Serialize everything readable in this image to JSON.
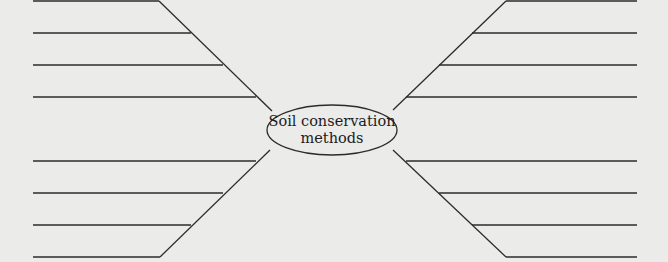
{
  "diagram": {
    "type": "spider-map",
    "center": {
      "line1": "Soil conservation",
      "line2": "methods"
    },
    "branches": [
      {
        "position": "top-left",
        "blank_lines": 4
      },
      {
        "position": "top-right",
        "blank_lines": 4
      },
      {
        "position": "bottom-left",
        "blank_lines": 4
      },
      {
        "position": "bottom-right",
        "blank_lines": 4
      }
    ],
    "colors": {
      "background": "#ebebea",
      "ink": "#2b2b2b"
    }
  }
}
